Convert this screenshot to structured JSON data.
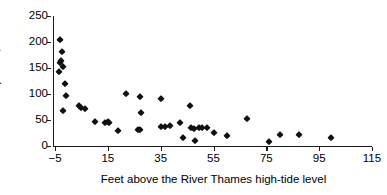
{
  "chart_data": {
    "type": "scatter",
    "title": "",
    "xlabel": "Feet above the River Thames high-tide level",
    "ylabel": "Cholera deaths per 10,000",
    "xlim": [
      -5,
      115
    ],
    "ylim": [
      0,
      250
    ],
    "xticks": [
      -5,
      15,
      35,
      55,
      75,
      95,
      115
    ],
    "xtick_labels": [
      "−5",
      "15",
      "35",
      "55",
      "75",
      "95",
      "115"
    ],
    "yticks": [
      0,
      50,
      100,
      150,
      200,
      250
    ],
    "ytick_labels": [
      "0",
      "50",
      "100",
      "150",
      "200",
      "250"
    ],
    "grid": false,
    "legend": null,
    "marker": "diamond",
    "marker_color": "#111111",
    "points": [
      {
        "x": -3.0,
        "y": 204
      },
      {
        "x": -3.5,
        "y": 143
      },
      {
        "x": -2.2,
        "y": 181
      },
      {
        "x": -2.8,
        "y": 163
      },
      {
        "x": -3.0,
        "y": 159
      },
      {
        "x": -2.0,
        "y": 152
      },
      {
        "x": -1.4,
        "y": 120
      },
      {
        "x": -0.8,
        "y": 97
      },
      {
        "x": -1.8,
        "y": 68
      },
      {
        "x": 4.0,
        "y": 76
      },
      {
        "x": 5.0,
        "y": 74
      },
      {
        "x": 6.5,
        "y": 71
      },
      {
        "x": 10.0,
        "y": 47
      },
      {
        "x": 14.0,
        "y": 45
      },
      {
        "x": 15.0,
        "y": 46
      },
      {
        "x": 15.5,
        "y": 44
      },
      {
        "x": 19.0,
        "y": 28
      },
      {
        "x": 22.0,
        "y": 100
      },
      {
        "x": 27.0,
        "y": 95
      },
      {
        "x": 27.5,
        "y": 64
      },
      {
        "x": 26.5,
        "y": 31
      },
      {
        "x": 27.0,
        "y": 30
      },
      {
        "x": 35.0,
        "y": 90
      },
      {
        "x": 35.0,
        "y": 37
      },
      {
        "x": 36.5,
        "y": 36
      },
      {
        "x": 38.5,
        "y": 38
      },
      {
        "x": 42.5,
        "y": 45
      },
      {
        "x": 43.5,
        "y": 16
      },
      {
        "x": 46.0,
        "y": 76
      },
      {
        "x": 46.5,
        "y": 34
      },
      {
        "x": 47.5,
        "y": 33
      },
      {
        "x": 49.5,
        "y": 35
      },
      {
        "x": 50.5,
        "y": 34
      },
      {
        "x": 48.0,
        "y": 9
      },
      {
        "x": 52.5,
        "y": 35
      },
      {
        "x": 55.0,
        "y": 25
      },
      {
        "x": 60.0,
        "y": 19
      },
      {
        "x": 67.5,
        "y": 52
      },
      {
        "x": 76.0,
        "y": 8
      },
      {
        "x": 80.0,
        "y": 21
      },
      {
        "x": 87.5,
        "y": 21
      },
      {
        "x": 99.5,
        "y": 16
      }
    ]
  },
  "axes": {
    "y_title": "Cholera deaths per 10,000",
    "x_title": "Feet above the River Thames high-tide level"
  }
}
